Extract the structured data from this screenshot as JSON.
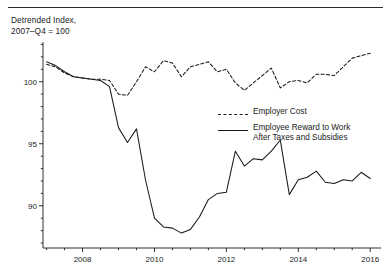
{
  "figure": {
    "background": "#ffffff",
    "ink_color": "#1a1a1a",
    "axis_title": "Detrended Index,\n2007–Q4 = 100"
  },
  "legend": {
    "position": "inside-right",
    "entries": [
      {
        "label": "Employer Cost",
        "style": "dashed",
        "name": "employer-cost"
      },
      {
        "label": "Employee Reward to Work\nAfter Taxes and Subsidies",
        "style": "solid",
        "name": "employee-reward"
      }
    ]
  },
  "chart_data": {
    "type": "line",
    "title": "Detrended Index, 2007–Q4 = 100",
    "xlabel": "",
    "ylabel": "Detrended Index, 2007–Q4 = 100",
    "xlim": [
      2006.9,
      2016.3
    ],
    "ylim": [
      86.6,
      103.2
    ],
    "grid": false,
    "y_ticks": [
      90,
      95,
      100
    ],
    "y_minor_tick_step": 1,
    "x_ticks": [
      2008,
      2010,
      2012,
      2014,
      2016
    ],
    "x_minor_tick_step": 0.5,
    "legend_position": "inside-right",
    "series": [
      {
        "name": "Employer Cost",
        "style": "dashed",
        "x": [
          2007.0,
          2007.25,
          2007.5,
          2007.75,
          2008.0,
          2008.25,
          2008.5,
          2008.75,
          2009.0,
          2009.25,
          2009.5,
          2009.75,
          2010.0,
          2010.25,
          2010.5,
          2010.75,
          2011.0,
          2011.25,
          2011.5,
          2011.75,
          2012.0,
          2012.25,
          2012.5,
          2012.75,
          2013.0,
          2013.25,
          2013.5,
          2013.75,
          2014.0,
          2014.25,
          2014.5,
          2014.75,
          2015.0,
          2015.25,
          2015.5,
          2015.75,
          2016.0
        ],
        "values": [
          101.4,
          101.2,
          100.7,
          100.4,
          100.3,
          100.2,
          100.2,
          100.1,
          99.0,
          98.9,
          100.0,
          101.2,
          100.8,
          101.7,
          101.5,
          100.4,
          101.2,
          101.4,
          101.6,
          100.8,
          101.0,
          99.9,
          99.3,
          99.9,
          100.5,
          101.1,
          99.5,
          100.0,
          100.1,
          99.9,
          100.6,
          100.6,
          100.5,
          101.2,
          101.9,
          102.1,
          102.3
        ]
      },
      {
        "name": "Employee Reward to Work After Taxes and Subsidies",
        "style": "solid",
        "x": [
          2007.0,
          2007.25,
          2007.5,
          2007.75,
          2008.0,
          2008.25,
          2008.5,
          2008.75,
          2009.0,
          2009.25,
          2009.5,
          2009.75,
          2010.0,
          2010.25,
          2010.5,
          2010.75,
          2011.0,
          2011.25,
          2011.5,
          2011.75,
          2012.0,
          2012.25,
          2012.5,
          2012.75,
          2013.0,
          2013.25,
          2013.5,
          2013.75,
          2014.0,
          2014.25,
          2014.5,
          2014.75,
          2015.0,
          2015.25,
          2015.5,
          2015.75,
          2016.0
        ],
        "values": [
          101.6,
          101.3,
          100.8,
          100.4,
          100.3,
          100.2,
          100.1,
          99.6,
          96.3,
          95.1,
          96.2,
          92.1,
          89.0,
          88.3,
          88.2,
          87.8,
          88.1,
          89.1,
          90.5,
          91.0,
          91.1,
          94.4,
          93.2,
          93.8,
          93.7,
          94.4,
          95.3,
          90.9,
          92.1,
          92.3,
          92.8,
          91.9,
          91.8,
          92.1,
          92.0,
          92.7,
          92.2
        ]
      }
    ]
  }
}
